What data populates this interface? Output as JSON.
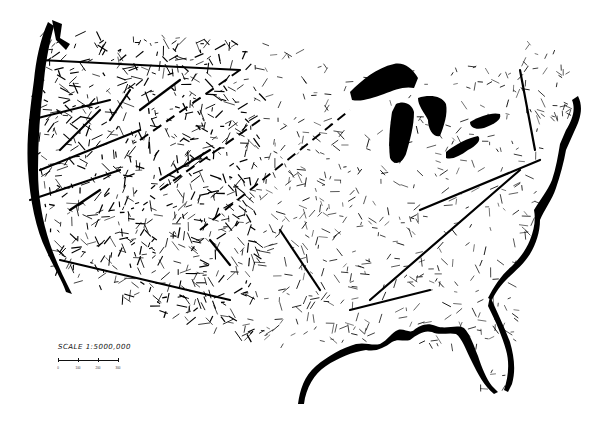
{
  "map": {
    "title": "",
    "subject": "Lineament map of the conterminous United States",
    "colors": {
      "ink": "#000000",
      "paper": "#ffffff"
    },
    "features": {
      "coastlines": [
        "pacific-coast",
        "gulf-coast",
        "atlantic-coast",
        "florida-peninsula"
      ],
      "lakes": [
        "lake-superior",
        "lake-michigan",
        "lake-huron",
        "lake-erie",
        "lake-ontario"
      ],
      "lineaments": "dense short dashed and solid strokes, heaviest in the west"
    }
  },
  "scale": {
    "label": "SCALE 1:5000,000",
    "ticks": [
      "0",
      "100",
      "200",
      "300"
    ]
  }
}
